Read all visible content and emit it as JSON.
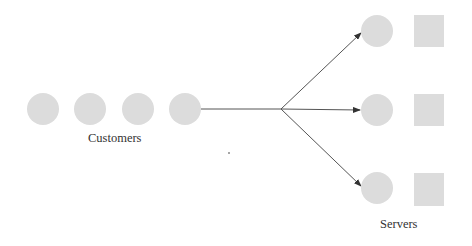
{
  "diagram": {
    "type": "queueing-system",
    "colors": {
      "node_fill": "#dcdcdc",
      "edge": "#555555",
      "text": "#333333",
      "background": "#ffffff"
    },
    "customers": {
      "label": "Customers",
      "count": 4
    },
    "servers": {
      "label": "Servers",
      "count": 3
    }
  }
}
